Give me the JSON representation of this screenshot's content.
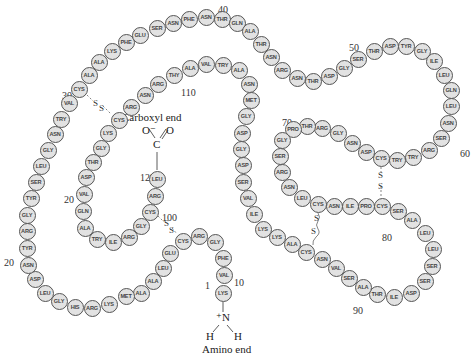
{
  "diagram": {
    "carboxyl_label": "Carboxyl end",
    "amino_label": "Amino end",
    "carboxyl_group": {
      "o_minus": "O⁻",
      "o": "O",
      "c": "C"
    },
    "amino_group": {
      "n": "⁺N",
      "h1": "H",
      "h2": "H"
    },
    "disulfide_label": "S",
    "numbers": [
      {
        "text": "1",
        "x": 205,
        "y": 286
      },
      {
        "text": "10",
        "x": 234,
        "y": 283
      },
      {
        "text": "20",
        "x": 4,
        "y": 263
      },
      {
        "text": "20",
        "x": 64,
        "y": 200
      },
      {
        "text": "30",
        "x": 62,
        "y": 96
      },
      {
        "text": "40",
        "x": 218,
        "y": 10
      },
      {
        "text": "50",
        "x": 349,
        "y": 48
      },
      {
        "text": "60",
        "x": 460,
        "y": 154
      },
      {
        "text": "70",
        "x": 282,
        "y": 123
      },
      {
        "text": "80",
        "x": 382,
        "y": 238
      },
      {
        "text": "90",
        "x": 353,
        "y": 311
      },
      {
        "text": "100",
        "x": 162,
        "y": 218
      },
      {
        "text": "110",
        "x": 181,
        "y": 93
      },
      {
        "text": "129",
        "x": 140,
        "y": 178
      }
    ],
    "residues": [
      {
        "n": "LYS",
        "x": 223,
        "y": 293
      },
      {
        "n": "VAL",
        "x": 224,
        "y": 275
      },
      {
        "n": "PHE",
        "x": 223,
        "y": 258
      },
      {
        "n": "GLY",
        "x": 215,
        "y": 242
      },
      {
        "n": "ARG",
        "x": 199,
        "y": 236
      },
      {
        "n": "CYS",
        "x": 183,
        "y": 241
      },
      {
        "n": "GLU",
        "x": 170,
        "y": 253
      },
      {
        "n": "LEU",
        "x": 163,
        "y": 268
      },
      {
        "n": "ALA",
        "x": 153,
        "y": 281
      },
      {
        "n": "ALA",
        "x": 141,
        "y": 293
      },
      {
        "n": "MET",
        "x": 126,
        "y": 296
      },
      {
        "n": "LYS",
        "x": 109,
        "y": 304
      },
      {
        "n": "ARG",
        "x": 92,
        "y": 308
      },
      {
        "n": "HIS",
        "x": 75,
        "y": 307
      },
      {
        "n": "GLY",
        "x": 59,
        "y": 301
      },
      {
        "n": "LEU",
        "x": 45,
        "y": 293
      },
      {
        "n": "ASP",
        "x": 35,
        "y": 279
      },
      {
        "n": "ASN",
        "x": 28,
        "y": 265
      },
      {
        "n": "TYR",
        "x": 27,
        "y": 248
      },
      {
        "n": "ARG",
        "x": 27,
        "y": 231
      },
      {
        "n": "GLY",
        "x": 27,
        "y": 215
      },
      {
        "n": "TYR",
        "x": 31,
        "y": 198
      },
      {
        "n": "SER",
        "x": 36,
        "y": 182
      },
      {
        "n": "LEU",
        "x": 41,
        "y": 166
      },
      {
        "n": "GLY",
        "x": 48,
        "y": 150
      },
      {
        "n": "ASN",
        "x": 55,
        "y": 134
      },
      {
        "n": "TRY",
        "x": 61,
        "y": 119
      },
      {
        "n": "VAL",
        "x": 69,
        "y": 103
      },
      {
        "n": "CYS",
        "x": 79,
        "y": 89
      },
      {
        "n": "ALA",
        "x": 89,
        "y": 75
      },
      {
        "n": "ALA",
        "x": 99,
        "y": 62
      },
      {
        "n": "LYS",
        "x": 112,
        "y": 51
      },
      {
        "n": "PHE",
        "x": 126,
        "y": 42
      },
      {
        "n": "GLU",
        "x": 140,
        "y": 35
      },
      {
        "n": "SER",
        "x": 157,
        "y": 28
      },
      {
        "n": "ASN",
        "x": 173,
        "y": 23
      },
      {
        "n": "PHE",
        "x": 189,
        "y": 19
      },
      {
        "n": "ASN",
        "x": 206,
        "y": 17
      },
      {
        "n": "THR",
        "x": 222,
        "y": 19
      },
      {
        "n": "GLN",
        "x": 237,
        "y": 23
      },
      {
        "n": "ALA",
        "x": 250,
        "y": 31
      },
      {
        "n": "THR",
        "x": 261,
        "y": 44
      },
      {
        "n": "ASN",
        "x": 271,
        "y": 57
      },
      {
        "n": "ARG",
        "x": 282,
        "y": 70
      },
      {
        "n": "ASN",
        "x": 297,
        "y": 78
      },
      {
        "n": "THR",
        "x": 313,
        "y": 81
      },
      {
        "n": "ASP",
        "x": 329,
        "y": 76
      },
      {
        "n": "GLY",
        "x": 344,
        "y": 68
      },
      {
        "n": "SER",
        "x": 358,
        "y": 59
      },
      {
        "n": "THR",
        "x": 374,
        "y": 51
      },
      {
        "n": "ASP",
        "x": 390,
        "y": 46
      },
      {
        "n": "TYR",
        "x": 406,
        "y": 46
      },
      {
        "n": "GLY",
        "x": 422,
        "y": 51
      },
      {
        "n": "ILE",
        "x": 434,
        "y": 61
      },
      {
        "n": "LEU",
        "x": 444,
        "y": 75
      },
      {
        "n": "GLN",
        "x": 451,
        "y": 90
      },
      {
        "n": "LEU",
        "x": 451,
        "y": 106
      },
      {
        "n": "ASN",
        "x": 448,
        "y": 123
      },
      {
        "n": "SER",
        "x": 441,
        "y": 138
      },
      {
        "n": "ARG",
        "x": 429,
        "y": 150
      },
      {
        "n": "TRY",
        "x": 413,
        "y": 157
      },
      {
        "n": "TRY",
        "x": 397,
        "y": 160
      },
      {
        "n": "CYS",
        "x": 381,
        "y": 158
      },
      {
        "n": "ASP",
        "x": 366,
        "y": 152
      },
      {
        "n": "ASN",
        "x": 352,
        "y": 143
      },
      {
        "n": "GLY",
        "x": 338,
        "y": 133
      },
      {
        "n": "ARG",
        "x": 322,
        "y": 128
      },
      {
        "n": "THR",
        "x": 307,
        "y": 126
      },
      {
        "n": "PRO",
        "x": 293,
        "y": 129
      },
      {
        "n": "GLY",
        "x": 282,
        "y": 140
      },
      {
        "n": "SER",
        "x": 280,
        "y": 156
      },
      {
        "n": "ARG",
        "x": 282,
        "y": 172
      },
      {
        "n": "ASN",
        "x": 289,
        "y": 187
      },
      {
        "n": "LEU",
        "x": 302,
        "y": 198
      },
      {
        "n": "CYS",
        "x": 318,
        "y": 204
      },
      {
        "n": "ASN",
        "x": 334,
        "y": 206
      },
      {
        "n": "ILE",
        "x": 350,
        "y": 206
      },
      {
        "n": "PRO",
        "x": 366,
        "y": 206
      },
      {
        "n": "CYS",
        "x": 382,
        "y": 206
      },
      {
        "n": "SER",
        "x": 398,
        "y": 211
      },
      {
        "n": "ALA",
        "x": 412,
        "y": 220
      },
      {
        "n": "LEU",
        "x": 425,
        "y": 233
      },
      {
        "n": "LEU",
        "x": 433,
        "y": 249
      },
      {
        "n": "SER",
        "x": 432,
        "y": 266
      },
      {
        "n": "SER",
        "x": 425,
        "y": 281
      },
      {
        "n": "ASP",
        "x": 411,
        "y": 293
      },
      {
        "n": "ILE",
        "x": 394,
        "y": 297
      },
      {
        "n": "THR",
        "x": 377,
        "y": 294
      },
      {
        "n": "ALA",
        "x": 363,
        "y": 287
      },
      {
        "n": "SER",
        "x": 349,
        "y": 278
      },
      {
        "n": "VAL",
        "x": 336,
        "y": 268
      },
      {
        "n": "ASN",
        "x": 322,
        "y": 259
      },
      {
        "n": "CYS",
        "x": 306,
        "y": 252
      },
      {
        "n": "ALA",
        "x": 292,
        "y": 244
      },
      {
        "n": "LYS",
        "x": 277,
        "y": 237
      },
      {
        "n": "LYS",
        "x": 263,
        "y": 229
      },
      {
        "n": "ILE",
        "x": 254,
        "y": 214
      },
      {
        "n": "VAL",
        "x": 248,
        "y": 198
      },
      {
        "n": "SER",
        "x": 243,
        "y": 182
      },
      {
        "n": "ASP",
        "x": 243,
        "y": 165
      },
      {
        "n": "GLY",
        "x": 241,
        "y": 149
      },
      {
        "n": "ASP",
        "x": 242,
        "y": 133
      },
      {
        "n": "GLY",
        "x": 246,
        "y": 116
      },
      {
        "n": "MET",
        "x": 251,
        "y": 100
      },
      {
        "n": "ASN",
        "x": 249,
        "y": 84
      },
      {
        "n": "ALA",
        "x": 239,
        "y": 70
      },
      {
        "n": "TRY",
        "x": 223,
        "y": 65
      },
      {
        "n": "VAL",
        "x": 206,
        "y": 64
      },
      {
        "n": "ALA",
        "x": 190,
        "y": 68
      },
      {
        "n": "THY",
        "x": 174,
        "y": 75
      },
      {
        "n": "ARG",
        "x": 158,
        "y": 84
      },
      {
        "n": "ASN",
        "x": 145,
        "y": 95
      },
      {
        "n": "ARG",
        "x": 131,
        "y": 107
      },
      {
        "n": "CYS",
        "x": 119,
        "y": 120
      },
      {
        "n": "LYS",
        "x": 108,
        "y": 133
      },
      {
        "n": "GLY",
        "x": 101,
        "y": 148
      },
      {
        "n": "THR",
        "x": 93,
        "y": 162
      },
      {
        "n": "ASP",
        "x": 86,
        "y": 177
      },
      {
        "n": "VAL",
        "x": 84,
        "y": 194
      },
      {
        "n": "GLN",
        "x": 83,
        "y": 211
      },
      {
        "n": "ALA",
        "x": 85,
        "y": 228
      },
      {
        "n": "TRY",
        "x": 97,
        "y": 239
      },
      {
        "n": "ILE",
        "x": 113,
        "y": 242
      },
      {
        "n": "ARG",
        "x": 129,
        "y": 237
      },
      {
        "n": "GLY",
        "x": 141,
        "y": 226
      },
      {
        "n": "CYS",
        "x": 150,
        "y": 212
      },
      {
        "n": "ARG",
        "x": 155,
        "y": 196
      },
      {
        "n": "LEU",
        "x": 157,
        "y": 179
      }
    ]
  }
}
